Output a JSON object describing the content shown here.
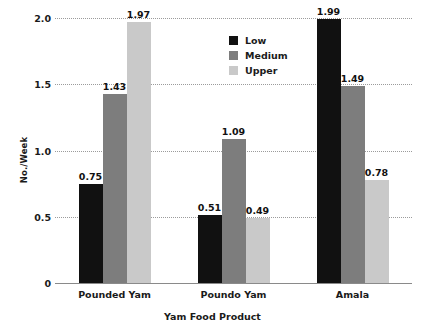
{
  "chart_data": {
    "type": "bar",
    "title": "",
    "xlabel": "Yam Food Product",
    "ylabel": "No./Week",
    "categories": [
      "Pounded Yam",
      "Poundo Yam",
      "Amala"
    ],
    "series": [
      {
        "name": "Low",
        "color": "#111111",
        "values": [
          0.75,
          0.51,
          1.99
        ]
      },
      {
        "name": "Medium",
        "color": "#7d7d7d",
        "values": [
          1.43,
          1.09,
          1.49
        ]
      },
      {
        "name": "Upper",
        "color": "#c9c9c9",
        "values": [
          1.97,
          0.49,
          0.78
        ]
      }
    ],
    "value_labels": [
      [
        "0.75",
        "1.43",
        "1.97"
      ],
      [
        "0.51",
        "1.09",
        "0.49"
      ],
      [
        "1.99",
        "1.49",
        "0.78"
      ]
    ],
    "ylim": [
      0,
      2.0
    ],
    "yticks": [
      0,
      0.5,
      1.0,
      1.5,
      2.0
    ],
    "ytick_labels": [
      "0",
      "0.5",
      "1.0",
      "1.5",
      "2.0"
    ],
    "grid": true,
    "grid_style": "dotted",
    "legend_position": "top-center"
  }
}
